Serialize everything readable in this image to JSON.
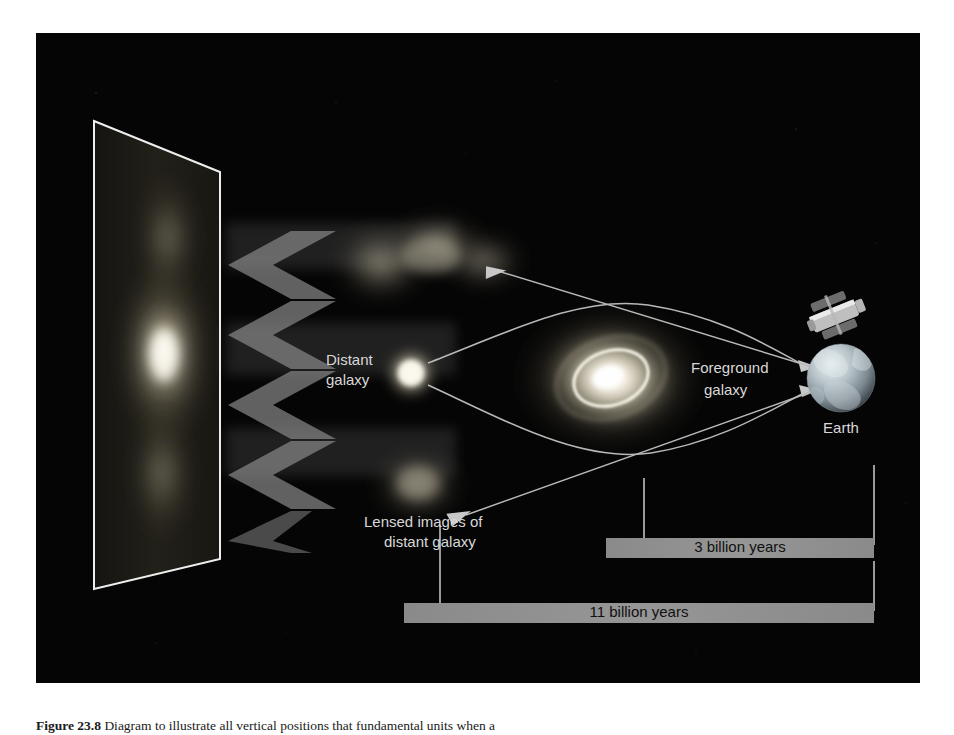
{
  "figure": {
    "background_color": "#050505",
    "labels": {
      "distant_galaxy": [
        "Distant",
        "galaxy"
      ],
      "foreground_galaxy": [
        "Foreground",
        "galaxy"
      ],
      "lensed_images": [
        "Lensed images of",
        "distant galaxy"
      ],
      "earth": "Earth"
    },
    "distance_bars": [
      {
        "label": "3 billion years",
        "color": "#8e8e8e"
      },
      {
        "label": "11 billion years",
        "color": "#8e8e8e"
      }
    ],
    "objects": {
      "image_plane": "distorted-image-plane",
      "distant_galaxy": "point-source-galaxy",
      "foreground_galaxy": "lensing-spiral-galaxy",
      "earth": "earth-globe",
      "telescope": "hubble-space-telescope",
      "lensed_image_top": "arc-lensed-image",
      "lensed_image_bottom": "blob-lensed-image"
    },
    "ray_color": "#b9b9b9",
    "plane_outline_color": "#e8e8e8"
  },
  "caption": {
    "number": "Figure 23.8",
    "text": "Diagram to illustrate all vertical positions that fundamental units when a"
  }
}
